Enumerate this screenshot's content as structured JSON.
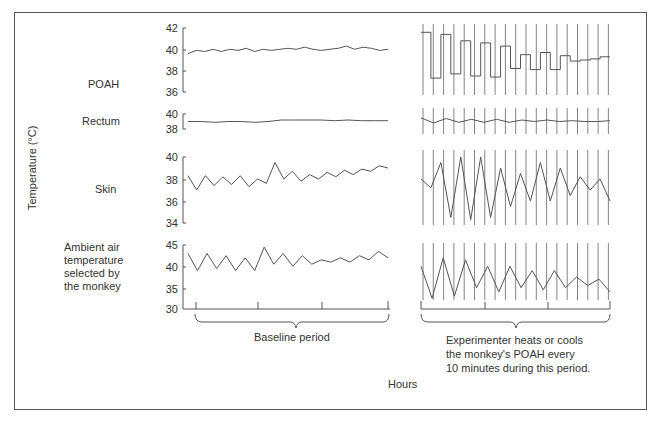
{
  "chart_data": {
    "type": "line",
    "title": "",
    "xlabel": "Hours",
    "ylabel": "Temperature (°C)",
    "panels": [
      {
        "name": "POAH",
        "yticks": [
          36,
          38,
          40,
          42
        ],
        "ylim": [
          36,
          42
        ],
        "baseline": {
          "description": "steady around 39.9 °C",
          "values": [
            39.6,
            39.9,
            39.8,
            40.0,
            39.8,
            40.0,
            39.9,
            40.1,
            39.8,
            40.0,
            39.9,
            40.0,
            40.1,
            40.0,
            40.2,
            40.0,
            39.9,
            40.0,
            40.1,
            40.3,
            40.0,
            40.2,
            40.1,
            39.9,
            40.0
          ]
        },
        "experiment": {
          "description": "square-wave alternation between heated/cooled, amplitude decreasing",
          "values": [
            41.6,
            37.3,
            41.4,
            37.7,
            40.8,
            37.5,
            40.6,
            37.4,
            40.3,
            38.2,
            39.5,
            38.1,
            39.7,
            38.1,
            39.4,
            38.9,
            39.0,
            39.1,
            39.3
          ]
        }
      },
      {
        "name": "Rectum",
        "yticks": [
          38,
          40
        ],
        "ylim": [
          38,
          40
        ],
        "baseline": {
          "description": "steady around 39 °C",
          "values": [
            39.0,
            39.0,
            38.9,
            39.0,
            39.0,
            38.9,
            39.0,
            39.2,
            39.2,
            39.2,
            39.2,
            39.1,
            39.2,
            39.1,
            39.1,
            39.1
          ]
        },
        "experiment": {
          "description": "small oscillation ~39 °C in sync with POAH switching",
          "values": [
            39.5,
            38.8,
            39.4,
            38.9,
            39.3,
            38.9,
            39.3,
            38.9,
            39.2,
            39.0,
            39.2,
            39.0,
            39.1,
            39.0,
            39.0,
            39.1
          ]
        }
      },
      {
        "name": "Skin",
        "yticks": [
          34,
          36,
          38,
          40
        ],
        "ylim": [
          34,
          40
        ],
        "baseline": {
          "description": "fluctuating 36.5-39.5 °C, trending upward",
          "values": [
            38.3,
            37.0,
            38.3,
            37.4,
            38.2,
            37.5,
            38.3,
            37.3,
            38.0,
            37.6,
            39.5,
            38.0,
            38.7,
            37.8,
            38.4,
            38.0,
            38.6,
            38.2,
            38.8,
            38.4,
            38.9,
            38.7,
            39.2,
            39.0
          ]
        },
        "experiment": {
          "description": "large oscillations 34-40 °C",
          "values": [
            38.0,
            37.2,
            39.5,
            34.5,
            40.0,
            34.3,
            40.0,
            34.5,
            39.0,
            35.5,
            38.5,
            36.0,
            39.5,
            36.0,
            39.0,
            36.5,
            38.2,
            37.0,
            38.0,
            36.0
          ]
        }
      },
      {
        "name": "Ambient air temperature selected by the monkey",
        "yticks": [
          30,
          35,
          40,
          45
        ],
        "ylim": [
          30,
          45
        ],
        "baseline": {
          "description": "fluctuating 39-44 °C",
          "values": [
            43.0,
            39.0,
            43.0,
            39.5,
            42.5,
            39.0,
            42.0,
            39.0,
            44.5,
            40.5,
            43.0,
            40.0,
            42.5,
            40.5,
            41.5,
            41.0,
            42.0,
            41.0,
            42.5,
            41.5,
            43.5,
            42.0
          ]
        },
        "experiment": {
          "description": "large oscillations 32-42 °C, damping",
          "values": [
            40.0,
            32.5,
            42.0,
            33.0,
            41.5,
            35.0,
            40.0,
            34.0,
            40.0,
            35.0,
            39.0,
            34.5,
            39.0,
            35.0,
            37.5,
            35.5,
            37.0,
            34.0
          ]
        }
      }
    ],
    "annotations": [
      "Baseline period",
      "Experimenter heats or cools the monkey's POAH every 10 minutes during this period."
    ]
  },
  "labels": {
    "ylabel": "Temperature (°C)",
    "xlabel": "Hours",
    "poah": "POAH",
    "rectum": "Rectum",
    "skin": "Skin",
    "ambient_1": "Ambient air",
    "ambient_2": "temperature",
    "ambient_3": "selected by",
    "ambient_4": "the monkey",
    "baseline": "Baseline period",
    "exp_1": "Experimenter heats or cools",
    "exp_2": "the monkey's POAH every",
    "exp_3": "10 minutes during this period."
  },
  "ticks": {
    "poah": [
      "42",
      "40",
      "38",
      "36"
    ],
    "rectum": [
      "40",
      "38"
    ],
    "skin": [
      "40",
      "38",
      "36",
      "34"
    ],
    "ambient": [
      "45",
      "40",
      "35",
      "30"
    ]
  }
}
